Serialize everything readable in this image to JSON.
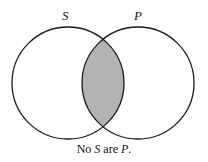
{
  "diagram": {
    "type": "venn",
    "sets": [
      {
        "id": "S",
        "label": "S",
        "cx": 68,
        "cy": 83,
        "r": 56
      },
      {
        "id": "P",
        "label": "P",
        "cx": 138,
        "cy": 83,
        "r": 56
      }
    ],
    "shaded_region": "S ∩ P",
    "shade_color": "#b3b3b3",
    "stroke_color": "#1a1a1a",
    "caption": {
      "prefix": "No ",
      "subject": "S",
      "middle": " are ",
      "predicate": "P",
      "suffix": "."
    }
  }
}
